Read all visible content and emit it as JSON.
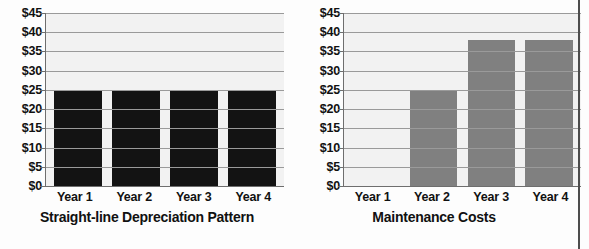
{
  "chart_data": [
    {
      "type": "bar",
      "title": "Straight-line Depreciation Pattern",
      "categories": [
        "Year 1",
        "Year 2",
        "Year 3",
        "Year 4"
      ],
      "values": [
        25,
        25,
        25,
        25
      ],
      "series": [
        {
          "name": "Depreciation",
          "values": [
            25,
            25,
            25,
            25
          ]
        }
      ],
      "xlabel": "",
      "ylabel": "",
      "ylim": [
        0,
        45
      ],
      "ytick_values": [
        0,
        5,
        10,
        15,
        20,
        25,
        30,
        35,
        40,
        45
      ],
      "ytick_labels": [
        "$0",
        "$5",
        "$10",
        "$15",
        "$20",
        "$25",
        "$30",
        "$35",
        "$40",
        "$45"
      ],
      "bar_color": "#131313",
      "plot_background": "#f2f2f2",
      "grid": true,
      "legend": "none"
    },
    {
      "type": "bar",
      "title": "Maintenance Costs",
      "categories": [
        "Year 1",
        "Year 2",
        "Year 3",
        "Year 4"
      ],
      "values": [
        0,
        25,
        38,
        38
      ],
      "series": [
        {
          "name": "Maintenance",
          "values": [
            0,
            25,
            38,
            38
          ]
        }
      ],
      "xlabel": "",
      "ylabel": "",
      "ylim": [
        0,
        45
      ],
      "ytick_values": [
        0,
        5,
        10,
        15,
        20,
        25,
        30,
        35,
        40,
        45
      ],
      "ytick_labels": [
        "$0",
        "$5",
        "$10",
        "$15",
        "$20",
        "$25",
        "$30",
        "$35",
        "$40",
        "$45"
      ],
      "bar_color": "#808080",
      "plot_background": "#f2f2f2",
      "grid": true,
      "legend": "none"
    }
  ]
}
